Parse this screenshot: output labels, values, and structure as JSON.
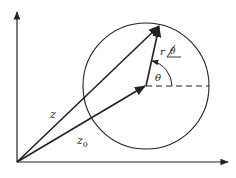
{
  "diagram": {
    "type": "complex-plane-circle",
    "labels": {
      "z": "z",
      "z0_base": "z",
      "z0_sub": "0",
      "r": "r",
      "theta_polar": "θ",
      "theta_angle": "θ"
    },
    "colors": {
      "stroke": "#222222",
      "background": "#ffffff"
    }
  }
}
